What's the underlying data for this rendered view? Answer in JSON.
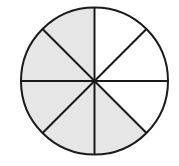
{
  "diagram": {
    "type": "fraction-circle",
    "total_parts": 8,
    "shaded_parts": 5,
    "fraction_shaded": "5/8",
    "shaded_sectors_clockwise_from_top": [
      false,
      false,
      false,
      true,
      true,
      true,
      true,
      true
    ],
    "colors": {
      "shaded": "#e6e6e6",
      "unshaded": "#ffffff",
      "stroke": "#1a1a1a"
    },
    "geometry": {
      "cx": 94.5,
      "cy": 81,
      "r": 73.5,
      "stroke_width": 2
    }
  }
}
